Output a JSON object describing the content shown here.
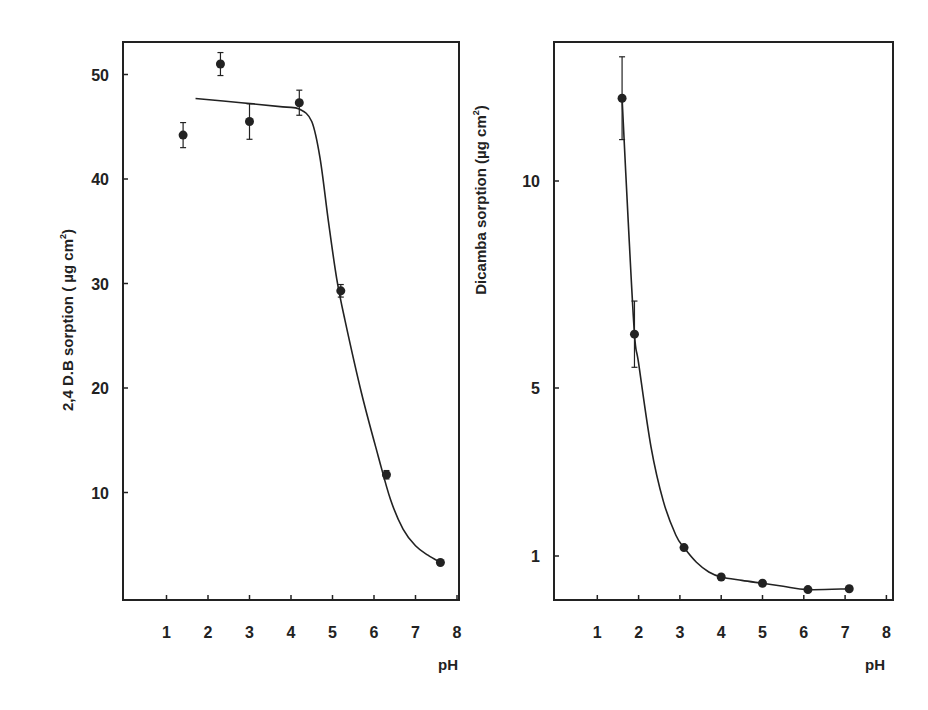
{
  "chart_data": [
    {
      "type": "scatter",
      "title": "",
      "xlabel": "pH",
      "ylabel": "2,4 D.B  sorption  ( µg  cm²)",
      "x_ticks": [
        1,
        2,
        3,
        4,
        5,
        6,
        7,
        8
      ],
      "y_ticks": [
        10,
        20,
        30,
        40,
        50
      ],
      "xlim": [
        0,
        8
      ],
      "ylim": [
        0,
        52
      ],
      "grid": false,
      "legend": null,
      "series": [
        {
          "name": "2,4 D.B",
          "points": [
            {
              "x": 1.4,
              "y": 44.2,
              "err": 1.2
            },
            {
              "x": 2.3,
              "y": 51.0,
              "err": 1.1
            },
            {
              "x": 3.0,
              "y": 45.5,
              "err": 1.7
            },
            {
              "x": 4.2,
              "y": 47.3,
              "err": 1.2
            },
            {
              "x": 5.2,
              "y": 29.3,
              "err": 0.6
            },
            {
              "x": 6.3,
              "y": 11.7,
              "err": 0.4
            },
            {
              "x": 7.6,
              "y": 3.3,
              "err": 0
            }
          ],
          "fit_curve": [
            [
              1.7,
              47.7
            ],
            [
              2.8,
              47.3
            ],
            [
              3.8,
              46.9
            ],
            [
              4.2,
              46.7
            ],
            [
              4.5,
              45.5
            ],
            [
              4.7,
              42.0
            ],
            [
              4.9,
              36.0
            ],
            [
              5.1,
              30.5
            ],
            [
              5.3,
              26.5
            ],
            [
              5.7,
              19.5
            ],
            [
              6.1,
              13.5
            ],
            [
              6.4,
              9.3
            ],
            [
              6.7,
              6.5
            ],
            [
              7.0,
              4.9
            ],
            [
              7.3,
              4.0
            ],
            [
              7.6,
              3.3
            ]
          ]
        }
      ]
    },
    {
      "type": "scatter",
      "title": "",
      "xlabel": "pH",
      "ylabel": "Dicamba  sorption  (µg  cm²)",
      "x_ticks": [
        1,
        2,
        3,
        4,
        5,
        6,
        7,
        8
      ],
      "y_ticks": [
        1,
        5,
        10
      ],
      "xlim": [
        0,
        8
      ],
      "ylim": [
        0,
        14
      ],
      "y_scale": "non-linear (10→5 spacing larger than 5→1)",
      "grid": false,
      "legend": null,
      "series": [
        {
          "name": "Dicamba",
          "points": [
            {
              "x": 1.6,
              "y": 12.0,
              "err": 1.0
            },
            {
              "x": 1.9,
              "y": 6.3,
              "err": 0.8
            },
            {
              "x": 3.1,
              "y": 1.2,
              "err": 0
            },
            {
              "x": 4.0,
              "y": 0.5,
              "err": 0
            },
            {
              "x": 5.0,
              "y": 0.35,
              "err": 0
            },
            {
              "x": 6.1,
              "y": 0.2,
              "err": 0
            },
            {
              "x": 7.1,
              "y": 0.22,
              "err": 0
            }
          ],
          "fit_curve": [
            [
              1.6,
              12.0
            ],
            [
              1.75,
              9.0
            ],
            [
              1.9,
              6.3
            ],
            [
              2.0,
              5.6
            ],
            [
              2.3,
              3.6
            ],
            [
              2.6,
              2.3
            ],
            [
              2.9,
              1.5
            ],
            [
              3.1,
              1.2
            ],
            [
              3.4,
              0.85
            ],
            [
              3.7,
              0.62
            ],
            [
              4.0,
              0.5
            ],
            [
              4.5,
              0.42
            ],
            [
              5.0,
              0.35
            ],
            [
              5.5,
              0.28
            ],
            [
              6.1,
              0.2
            ],
            [
              7.1,
              0.22
            ]
          ]
        }
      ]
    }
  ],
  "panels": {
    "left": {
      "ylabel_main": "2,4 D.B  sorption  ( µg  cm",
      "ylabel_sup": "2",
      "ylabel_close": ")",
      "xlabel": "pH",
      "y_tick_labels": [
        "10",
        "20",
        "30",
        "40",
        "50"
      ],
      "x_tick_labels": [
        "1",
        "2",
        "3",
        "4",
        "5",
        "6",
        "7",
        "8"
      ]
    },
    "right": {
      "ylabel_main": "Dicamba  sorption  (µg  cm",
      "ylabel_sup": "2",
      "ylabel_close": ")",
      "xlabel": "pH",
      "y_tick_labels": [
        "1",
        "5",
        "10"
      ],
      "x_tick_labels": [
        "1",
        "2",
        "3",
        "4",
        "5",
        "6",
        "7",
        "8"
      ]
    }
  },
  "colors": {
    "ink": "#222222",
    "background": "#ffffff"
  }
}
